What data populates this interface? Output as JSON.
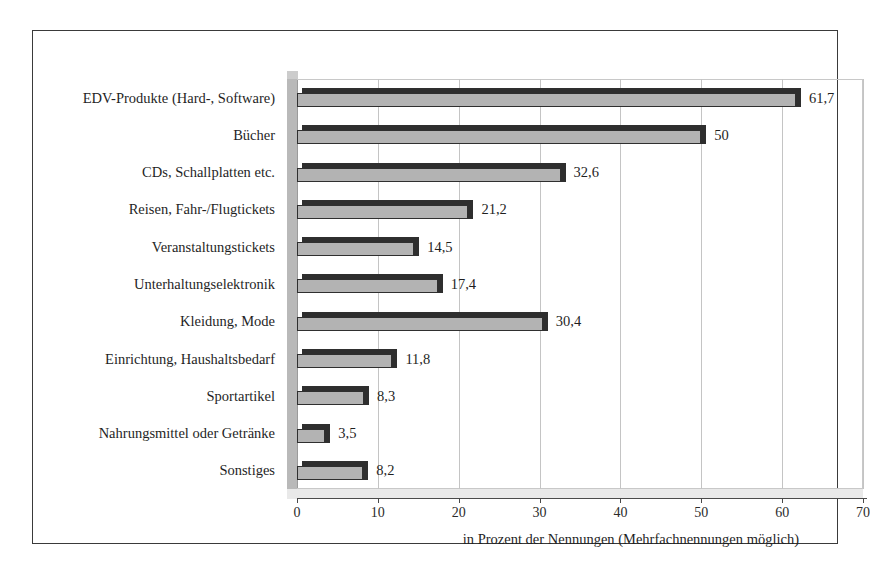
{
  "chart_data": {
    "type": "bar",
    "orientation": "horizontal",
    "title": "",
    "subtitle": "",
    "xlabel": "in Prozent der Nennungen (Mehrfachnennungen möglich)",
    "ylabel": "",
    "xlim": [
      0,
      70
    ],
    "xticks": [
      0,
      10,
      20,
      30,
      40,
      50,
      60,
      70
    ],
    "xtick_labels": [
      "0",
      "10",
      "20",
      "30",
      "40",
      "50",
      "60",
      "70"
    ],
    "grid": true,
    "grid_axis": "x",
    "legend": false,
    "style_3d": true,
    "categories": [
      "EDV-Produkte (Hard-, Software)",
      "Bücher",
      "CDs, Schallplatten etc.",
      "Reisen, Fahr-/Flugtickets",
      "Veranstaltungstickets",
      "Unterhaltungselektronik",
      "Kleidung, Mode",
      "Einrichtung, Haushaltsbedarf",
      "Sportartikel",
      "Nahrungsmittel oder Getränke",
      "Sonstiges"
    ],
    "values": [
      61.7,
      50,
      32.6,
      21.2,
      14.5,
      17.4,
      30.4,
      11.8,
      8.3,
      3.5,
      8.2
    ],
    "value_labels": [
      "61,7",
      "50",
      "32,6",
      "21,2",
      "14,5",
      "17,4",
      "30,4",
      "11,8",
      "8,3",
      "3,5",
      "8,2"
    ],
    "colors": {
      "bar_fill": "#b3b3b3",
      "bar_edge": "#2f2f2f",
      "bar_side": "#2e2e2e",
      "grid": "#c4c4c4",
      "wall": "#b9b9b9",
      "floor": "#e9e9e9",
      "frame": "#3a3a3a",
      "text": "#1f1f1f"
    }
  }
}
